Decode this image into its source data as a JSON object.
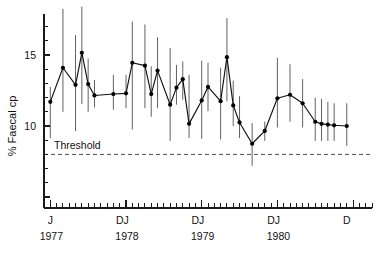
{
  "chart_data": {
    "type": "line",
    "title": "",
    "subtitle": "",
    "xlabel": "",
    "ylabel": "% Faecal cp",
    "ylim": [
      3.0,
      18.6
    ],
    "xlim": [
      1977.0,
      1981.25
    ],
    "grid": false,
    "legend": false,
    "yticks": [
      5,
      10,
      15
    ],
    "ytick_labels": [
      "",
      "10",
      "15"
    ],
    "ytick_labels_visible": [
      "10",
      "15"
    ],
    "x_month_ticks": true,
    "xtick_month_labels": [
      "J",
      "D",
      "J",
      "D",
      "J",
      "D",
      "J",
      "D"
    ],
    "xtick_year_labels": [
      "1977",
      "1978",
      "1979",
      "1980"
    ],
    "annotations": [
      {
        "text": "Threshold",
        "x": 1977.15,
        "y": 8.35,
        "kind": "threshold-label"
      }
    ],
    "threshold": {
      "label": "Threshold",
      "value": 8.0,
      "style": "dashed",
      "color": "#3a3a3a"
    },
    "error_bars": {
      "style": "vertical-line",
      "color": "#4f4f4f"
    },
    "marker": {
      "shape": "circle",
      "color": "#000000",
      "size": 2.1
    },
    "line_color": "#111111",
    "series": [
      {
        "name": "% Faecal cp",
        "x": [
          1977.08,
          1977.25,
          1977.42,
          1977.58,
          1977.75,
          1977.92,
          1978.17,
          1978.33,
          1978.5,
          1978.67,
          1978.83,
          1979.0,
          1979.17,
          1979.33,
          1979.5,
          1979.67,
          1979.83,
          1980.0,
          1980.17,
          1980.33,
          1980.5,
          1980.67,
          1980.83,
          1981.0,
          1981.17,
          1981.33,
          1981.5,
          1981.67,
          1981.83,
          1982.0,
          1982.17,
          1982.33
        ],
        "x_index": [
          1,
          3,
          5,
          6,
          7,
          8,
          11,
          13,
          14,
          16,
          17,
          18,
          20,
          21,
          22,
          23,
          25,
          26,
          28,
          29,
          30,
          31,
          33,
          35,
          37,
          39,
          41,
          43,
          44,
          45,
          46,
          48
        ],
        "values": [
          11.7,
          14.1,
          12.9,
          15.15,
          12.95,
          12.15,
          12.25,
          12.3,
          14.45,
          14.25,
          12.25,
          13.9,
          11.5,
          12.7,
          13.3,
          10.15,
          11.8,
          12.75,
          11.75,
          14.85,
          11.45,
          10.25,
          8.75,
          9.65,
          11.95,
          12.2,
          11.6,
          10.3,
          10.15,
          10.1,
          10.05,
          10.0
        ],
        "err_low": [
          9.15,
          11.0,
          9.65,
          11.55,
          11.0,
          11.3,
          11.15,
          11.25,
          9.75,
          11.25,
          10.65,
          11.25,
          8.95,
          11.5,
          11.85,
          9.15,
          9.1,
          11.05,
          9.05,
          11.75,
          10.0,
          9.15,
          7.2,
          8.95,
          9.9,
          10.3,
          9.9,
          8.95,
          8.95,
          8.95,
          8.95,
          8.6
        ],
        "err_high": [
          12.75,
          18.25,
          16.4,
          18.4,
          14.75,
          13.25,
          13.6,
          13.6,
          17.35,
          17.15,
          14.2,
          16.25,
          15.5,
          14.3,
          14.55,
          13.6,
          14.6,
          14.45,
          14.1,
          17.6,
          13.2,
          12.1,
          10.2,
          10.3,
          14.8,
          14.35,
          13.3,
          12.0,
          11.9,
          11.7,
          11.6,
          11.6
        ]
      }
    ]
  },
  "axis": {
    "y_label": "% Faecal cp",
    "y_tick_15": "15",
    "y_tick_10": "10",
    "month_jan": "J",
    "month_dec": "D",
    "year_1977": "1977",
    "year_1978": "1978",
    "year_1979": "1979",
    "year_1980": "1980"
  },
  "threshold_label": "Threshold"
}
